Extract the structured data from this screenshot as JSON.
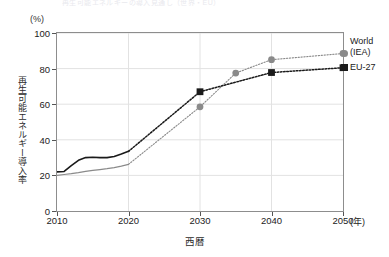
{
  "title_remnant": "再生可能エネルギーの導入見通し（世界・EU）",
  "axes": {
    "y_unit": "(%)",
    "y_label": "再生可能エネルギー導入率",
    "x_label": "西暦",
    "x_unit": "(年)",
    "y_ticks": [
      "0",
      "20",
      "40",
      "60",
      "80",
      "100"
    ],
    "x_ticks": [
      "2010",
      "2020",
      "2030",
      "2040",
      "2050"
    ]
  },
  "legend": {
    "world_line1": "World",
    "world_line2": "(IEA)",
    "eu": "EU-27"
  },
  "colors": {
    "world": "#8a8a8a",
    "eu": "#1a1a1a",
    "frame": "#8d8d8d",
    "grid": "#e2e2e2"
  },
  "chart_data": {
    "type": "line",
    "title": "再生可能エネルギーの導入見通し（世界・EU）",
    "xlabel": "西暦",
    "ylabel": "再生可能エネルギー導入率",
    "y_unit": "(%)",
    "x_unit": "(年)",
    "xlim": [
      2010,
      2050
    ],
    "ylim": [
      0,
      100
    ],
    "y_ticks": [
      0,
      20,
      40,
      60,
      80,
      100
    ],
    "x_ticks": [
      2010,
      2020,
      2030,
      2040,
      2050
    ],
    "grid": true,
    "legend_position": "right",
    "series": [
      {
        "name": "World (IEA)",
        "color": "#8a8a8a",
        "marker": "circle",
        "historical": {
          "style": "solid",
          "x": [
            2010,
            2011,
            2012,
            2013,
            2014,
            2015,
            2016,
            2017,
            2018,
            2019,
            2020
          ],
          "y": [
            20.0,
            20.5,
            21.0,
            21.6,
            22.3,
            22.8,
            23.3,
            23.8,
            24.4,
            25.2,
            26.2
          ]
        },
        "projection": {
          "style": "dotted",
          "x": [
            2020,
            2030,
            2035,
            2040,
            2050
          ],
          "y": [
            26.2,
            58.5,
            77.5,
            85.0,
            88.5
          ],
          "markers_at": [
            2030,
            2035,
            2040,
            2050
          ]
        }
      },
      {
        "name": "EU-27",
        "color": "#1a1a1a",
        "marker": "square",
        "historical": {
          "style": "solid",
          "x": [
            2010,
            2011,
            2012,
            2013,
            2014,
            2015,
            2016,
            2017,
            2018,
            2019,
            2020
          ],
          "y": [
            22.0,
            22.2,
            25.5,
            28.5,
            30.0,
            30.2,
            30.0,
            30.0,
            30.6,
            32.0,
            33.5
          ]
        },
        "projection": {
          "style": "dotted",
          "x": [
            2020,
            2030,
            2040,
            2050
          ],
          "y": [
            33.5,
            67.0,
            77.8,
            80.5
          ],
          "markers_at": [
            2030,
            2040,
            2050
          ]
        }
      }
    ]
  }
}
